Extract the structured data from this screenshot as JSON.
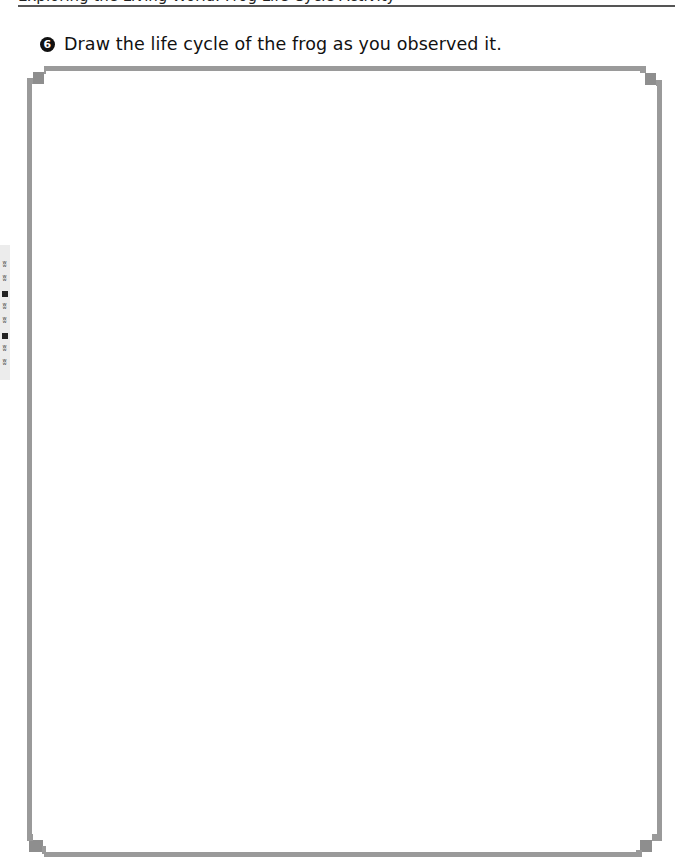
{
  "header": {
    "cut_off_text": "Exploring the Living World: Frog Life Cycle Activity"
  },
  "instruction": {
    "step_number": "6",
    "text": "Draw the life cycle of the frog as you observed it."
  },
  "side_tab": {
    "motif": "grass"
  },
  "drawing_area": {
    "frame_color": "#9a9a9a",
    "corner_style": "stepped-notch"
  }
}
